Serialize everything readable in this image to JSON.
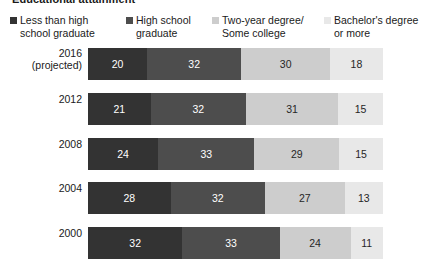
{
  "title_sliver": "Educational attainment",
  "legend": {
    "items": [
      {
        "label": "Less than high school graduate",
        "swatch": "#333333",
        "swatch_icon": "legend-square-icon"
      },
      {
        "label": "High school graduate",
        "swatch": "#4d4d4d",
        "swatch_icon": "legend-square-icon"
      },
      {
        "label": "Two-year degree/ Some college",
        "swatch": "#cdcdcd",
        "swatch_icon": "legend-square-icon"
      },
      {
        "label": "Bachelor's degree or more",
        "swatch": "#e8e8e8",
        "swatch_icon": "legend-square-icon"
      }
    ]
  },
  "rows": [
    {
      "label": "2016\n(projected)",
      "values": [
        20,
        32,
        30,
        18
      ]
    },
    {
      "label": "2012",
      "values": [
        21,
        32,
        31,
        15
      ]
    },
    {
      "label": "2008",
      "values": [
        24,
        33,
        29,
        15
      ]
    },
    {
      "label": "2004",
      "values": [
        28,
        32,
        27,
        13
      ]
    },
    {
      "label": "2000",
      "values": [
        32,
        33,
        24,
        11
      ]
    }
  ],
  "chart_data": {
    "type": "bar",
    "orientation": "horizontal",
    "stacked": true,
    "normalized_percent": true,
    "title": "Educational attainment",
    "xlabel": "",
    "ylabel": "",
    "xlim": [
      0,
      100
    ],
    "grid": false,
    "legend_position": "top",
    "categories": [
      "2016 (projected)",
      "2012",
      "2008",
      "2004",
      "2000"
    ],
    "series": [
      {
        "name": "Less than high school graduate",
        "color": "#333333",
        "values": [
          20,
          21,
          24,
          28,
          32
        ]
      },
      {
        "name": "High school graduate",
        "color": "#4d4d4d",
        "values": [
          32,
          32,
          33,
          32,
          33
        ]
      },
      {
        "name": "Two-year degree/Some college",
        "color": "#cdcdcd",
        "values": [
          30,
          31,
          29,
          27,
          24
        ]
      },
      {
        "name": "Bachelor's degree or more",
        "color": "#e8e8e8",
        "values": [
          18,
          15,
          15,
          13,
          11
        ]
      }
    ],
    "data_labels": [
      [
        20,
        32,
        30,
        18
      ],
      [
        21,
        32,
        31,
        15
      ],
      [
        24,
        33,
        29,
        15
      ],
      [
        28,
        32,
        27,
        13
      ],
      [
        32,
        33,
        24,
        11
      ]
    ],
    "tick_labels": [
      "2016 (projected)",
      "2012",
      "2008",
      "2004",
      "2000"
    ]
  },
  "colors": {
    "series_1": "#333333",
    "series_2": "#4d4d4d",
    "series_3": "#cdcdcd",
    "series_4": "#e8e8e8",
    "background": "#ffffff",
    "text": "#1a1a1a"
  }
}
